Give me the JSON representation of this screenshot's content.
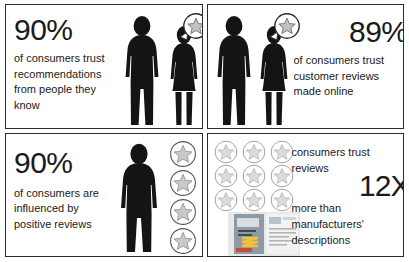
{
  "infographic": {
    "title": "Consumer trust in reviews infographic",
    "colors": {
      "text": "#1a1a1a",
      "silhouette": "#141414",
      "star_fill": "#c9c9c9",
      "star_outline": "#6e6e6e",
      "panel_border": "#2b2b2b",
      "background": "#ffffff"
    },
    "panels": [
      {
        "id": "panel-trust-recommendations",
        "stat": "90%",
        "lines": [
          "of consumers trust",
          "recommendations",
          "from people they",
          "know"
        ],
        "graphic": "man-and-woman-silhouettes-with-star-speech-bubble",
        "icons": [
          "man-silhouette-icon",
          "woman-silhouette-icon",
          "star-speech-bubble-icon"
        ]
      },
      {
        "id": "panel-trust-customer-reviews",
        "stat": "89%",
        "lines": [
          "of consumers trust",
          "customer reviews",
          "made online"
        ],
        "graphic": "man-and-woman-silhouettes-with-star-speech-bubble",
        "icons": [
          "man-silhouette-icon",
          "woman-silhouette-icon",
          "star-speech-bubble-icon"
        ]
      },
      {
        "id": "panel-influenced-positive-reviews",
        "stat": "90%",
        "lines": [
          "of consumers are",
          "influenced by",
          "positive reviews"
        ],
        "graphic": "man-silhouette-with-four-star-badges",
        "icons": [
          "man-silhouette-icon",
          "star-badge-icon"
        ],
        "star_count": 4
      },
      {
        "id": "panel-reviews-vs-manufacturer",
        "stat": "12X",
        "lines_before": [
          "consumers trust",
          "reviews"
        ],
        "lines_after": [
          "more than",
          "manufacturers'",
          "descriptions"
        ],
        "graphic": "nine-star-badge-grid-with-product-brochure",
        "icons": [
          "star-badge-icon",
          "product-brochure-icon"
        ],
        "star_count": 9
      }
    ]
  }
}
